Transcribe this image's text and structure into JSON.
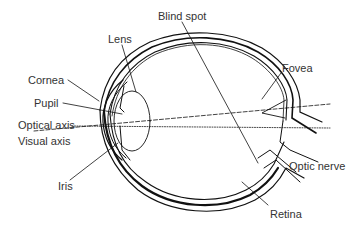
{
  "diagram": {
    "labels": {
      "blind_spot": "Blind spot",
      "lens": "Lens",
      "cornea": "Cornea",
      "pupil": "Pupil",
      "fovea": "Fovea",
      "optical_axis": "Optical axis",
      "visual_axis": "Visual axis",
      "optic_nerve": "Optic nerve",
      "iris": "Iris",
      "retina": "Retina"
    },
    "colors": {
      "line": "#111111",
      "text": "#333333",
      "background": "#ffffff"
    }
  }
}
